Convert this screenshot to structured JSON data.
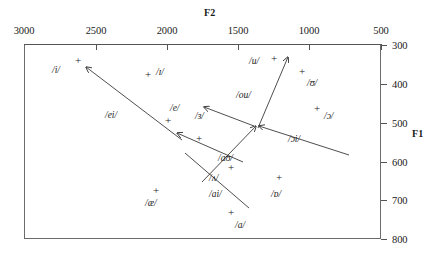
{
  "chart_data": {
    "type": "scatter",
    "title": "",
    "xlabel": "F2",
    "ylabel": "F1",
    "xlim": [
      3000,
      500
    ],
    "ylim": [
      300,
      800
    ],
    "x_axis_position": "top",
    "y_axis_position": "right",
    "x_reversed": true,
    "grid": false,
    "legend": null,
    "xticks": [
      3000,
      2500,
      2000,
      1500,
      1000,
      500
    ],
    "yticks": [
      300,
      400,
      500,
      600,
      700,
      800
    ],
    "xtick_labels": [
      "3000",
      "2500",
      "2000",
      "1500",
      "1000",
      "500"
    ],
    "ytick_labels": [
      "300",
      "400",
      "500",
      "600",
      "700",
      "800"
    ],
    "points": [
      {
        "label": "/i/",
        "marker": "+",
        "F2": 2830,
        "F1": 350,
        "label_side": "left"
      },
      {
        "label": "/ɪ/",
        "marker": "+",
        "F2": 2140,
        "F1": 365,
        "label_side": "right"
      },
      {
        "label": "/e/",
        "marker": "+",
        "F2": 1990,
        "F1": 490,
        "label_side": "above-right"
      },
      {
        "label": "/ɜ/",
        "marker": "+",
        "F2": 1820,
        "F1": 560,
        "label_side": "above"
      },
      {
        "label": "/æ/",
        "marker": "+",
        "F2": 2080,
        "F1": 690,
        "label_side": "below"
      },
      {
        "label": "/ʌ/",
        "marker": "+",
        "F2": 1740,
        "F1": 650,
        "label_side": "left"
      },
      {
        "label": "/a/",
        "marker": "+",
        "F2": 1650,
        "F1": 760,
        "label_side": "right"
      },
      {
        "label": "/ɒ/",
        "marker": "+",
        "F2": 1310,
        "F1": 690,
        "label_side": "below"
      },
      {
        "label": "/ɔ/",
        "marker": "+",
        "F2": 1180,
        "F1": 460,
        "label_side": "right"
      },
      {
        "label": "/ʊ/",
        "marker": "+",
        "F2": 1320,
        "F1": 370,
        "label_side": "right"
      },
      {
        "label": "/u/",
        "marker": "+",
        "F2": 1460,
        "F1": 330,
        "label_side": "left"
      }
    ],
    "diphthongs": [
      {
        "label": "/ei/",
        "from_F2": 1940,
        "from_F1": 560,
        "to_F2": 2790,
        "to_F1": 360
      },
      {
        "label": "/ou/",
        "from_F2": 1650,
        "from_F1": 500,
        "to_F2": 1410,
        "to_F1": 340
      },
      {
        "label": "/ɔi/",
        "from_F2": 1030,
        "from_F1": 570,
        "to_F2": 1660,
        "to_F1": 495
      },
      {
        "label": "/aʊ/",
        "from_F2": 1740,
        "from_F1": 660,
        "to_F2": 1650,
        "to_F1": 505
      },
      {
        "label": "/ai/",
        "from_F2": 1530,
        "from_F1": 740,
        "to_F2": 2020,
        "to_F1": 600
      },
      {
        "label": "/ɜ/",
        "from_F2": 1670,
        "from_F1": 520,
        "to_F2": 1890,
        "to_F1": 460
      }
    ]
  },
  "axes": {
    "top_title": "F2",
    "right_title": "F1",
    "top_ticks": [
      {
        "value": "3000",
        "x": 24
      },
      {
        "value": "2500",
        "x": 96
      },
      {
        "value": "2000",
        "x": 167
      },
      {
        "value": "1500",
        "x": 238
      },
      {
        "value": "1000",
        "x": 309
      },
      {
        "value": "500",
        "x": 381
      }
    ],
    "right_ticks": [
      {
        "value": "300",
        "y": 45
      },
      {
        "value": "400",
        "y": 84
      },
      {
        "value": "500",
        "y": 123
      },
      {
        "value": "600",
        "y": 162
      },
      {
        "value": "700",
        "y": 200
      },
      {
        "value": "800",
        "y": 239
      }
    ]
  },
  "markers": [
    {
      "name": "vowel-i",
      "glyph": "+",
      "x": 78,
      "y": 60,
      "label": "/i/",
      "lx": 52,
      "ly": 66
    },
    {
      "name": "vowel-small-i",
      "glyph": "+",
      "x": 148,
      "y": 74,
      "label": "/ɪ/",
      "lx": 156,
      "ly": 68
    },
    {
      "name": "vowel-e",
      "glyph": "+",
      "x": 168,
      "y": 120,
      "label": "/e/",
      "lx": 170,
      "ly": 104
    },
    {
      "name": "vowel-schwa",
      "glyph": "+",
      "x": 199,
      "y": 138,
      "label": "/ɜ/",
      "lx": 195,
      "ly": 112
    },
    {
      "name": "vowel-ae",
      "glyph": "+",
      "x": 156,
      "y": 190,
      "label": "/æ/",
      "lx": 145,
      "ly": 199
    },
    {
      "name": "vowel-wedge",
      "glyph": "+",
      "x": 231,
      "y": 167,
      "label": "/ʌ/",
      "lx": 209,
      "ly": 174
    },
    {
      "name": "vowel-a",
      "glyph": "+",
      "x": 231,
      "y": 212,
      "label": "/a/",
      "lx": 235,
      "ly": 221
    },
    {
      "name": "vowel-turned-script-a",
      "glyph": "+",
      "x": 279,
      "y": 177,
      "label": "/ɒ/",
      "lx": 271,
      "ly": 190
    },
    {
      "name": "vowel-open-o",
      "glyph": "+",
      "x": 317,
      "y": 108,
      "label": "/ɔ/",
      "lx": 324,
      "ly": 112
    },
    {
      "name": "vowel-upsilon",
      "glyph": "+",
      "x": 302,
      "y": 71,
      "label": "/ʊ/",
      "lx": 307,
      "ly": 79
    },
    {
      "name": "vowel-u",
      "glyph": "+",
      "x": 274,
      "y": 58,
      "label": "/u/",
      "lx": 249,
      "ly": 57
    }
  ],
  "diphthong_labels": [
    {
      "name": "diphthong-ei",
      "text": "/ei/",
      "x": 105,
      "y": 111
    },
    {
      "name": "diphthong-ou",
      "text": "/ou/",
      "x": 236,
      "y": 91
    },
    {
      "name": "diphthong-oi",
      "text": "/ɔi/",
      "x": 288,
      "y": 135
    },
    {
      "name": "diphthong-au",
      "text": "/aʊ/",
      "x": 218,
      "y": 154
    },
    {
      "name": "diphthong-ai",
      "text": "/ai/",
      "x": 209,
      "y": 190
    }
  ]
}
